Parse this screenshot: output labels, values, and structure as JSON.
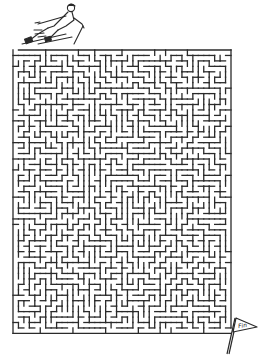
{
  "puzzle": {
    "type": "maze",
    "theme": "skiing",
    "start_label": "",
    "finish_flag_text": "Fin",
    "ink_color": "#2a2a2a",
    "background_color": "#ffffff"
  },
  "icons": {
    "start": "skier-icon",
    "finish": "finish-flag-icon"
  }
}
